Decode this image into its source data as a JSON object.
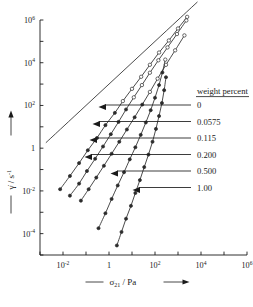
{
  "chart_data": {
    "type": "line",
    "title": "",
    "xlabel": "σ₂₁ / Pa",
    "ylabel": "γ̇ / s⁻¹",
    "xlabel_parts": {
      "dash": "——",
      "symbol": "σ",
      "subscript": "21",
      "slash": "/ Pa",
      "arrow": "⟶"
    },
    "ylabel_parts": {
      "dash": "——",
      "symbol": "γ̇",
      "slash": "/ s",
      "superscript": "-1",
      "arrow": "⟶"
    },
    "xscale": "log",
    "yscale": "log",
    "xlim": [
      0.001,
      1000000
    ],
    "ylim": [
      1e-05,
      1000000
    ],
    "grid": false,
    "legend_position": "right",
    "legend_title": "weight percent",
    "xticks_labeled": [
      "10⁻²",
      "1",
      "10²",
      "10⁴",
      "10⁶"
    ],
    "xtick_values": [
      0.01,
      1,
      100,
      10000,
      1000000
    ],
    "yticks_labeled": [
      "10⁶",
      "10⁴",
      "10²",
      "1",
      "10⁻²",
      "10⁻⁴"
    ],
    "ytick_values": [
      1000000,
      10000,
      100,
      1,
      0.01,
      0.0001
    ],
    "marker_note": "filled circles at low shear rate, open circles at high shear rate",
    "series": [
      {
        "name": "0",
        "label": "0",
        "marker": "none",
        "style": "straight-line",
        "x": [
          0.0018,
          0.01,
          0.1,
          1,
          10,
          100,
          1000,
          7000
        ],
        "y": [
          1.8,
          10,
          100,
          1000,
          10000,
          100000,
          1000000,
          7000000
        ]
      },
      {
        "name": "0.0575",
        "label": "0.0575",
        "marker": "mixed",
        "x": [
          0.0075,
          0.02,
          0.05,
          0.12,
          0.3,
          0.7,
          1.8,
          4,
          10,
          25,
          60,
          150,
          400,
          1000,
          2500
        ],
        "y": [
          0.012,
          0.05,
          0.2,
          0.8,
          3,
          12,
          45,
          160,
          600,
          2200,
          8000,
          30000,
          110000,
          400000,
          1400000
        ],
        "open_from_index": 7
      },
      {
        "name": "0.115",
        "label": "0.115",
        "marker": "mixed",
        "x": [
          0.02,
          0.05,
          0.11,
          0.25,
          0.55,
          1.2,
          2.6,
          5.5,
          12,
          27,
          60,
          140,
          350,
          900,
          2300
        ],
        "y": [
          0.006,
          0.022,
          0.085,
          0.32,
          1.2,
          4.5,
          17,
          65,
          240,
          900,
          3400,
          13000,
          52000,
          220000,
          950000
        ],
        "open_from_index": 8
      },
      {
        "name": "0.200",
        "label": "0.200",
        "marker": "mixed",
        "x": [
          0.06,
          0.13,
          0.28,
          0.6,
          1.3,
          2.8,
          6,
          13,
          28,
          60,
          130,
          300,
          750,
          1900
        ],
        "y": [
          0.0035,
          0.012,
          0.042,
          0.15,
          0.55,
          2.0,
          7.5,
          28,
          110,
          430,
          1800,
          8000,
          38000,
          190000
        ],
        "open_from_index": 9
      },
      {
        "name": "0.500",
        "label": "0.500",
        "marker": "filled",
        "x": [
          0.35,
          0.7,
          1.3,
          2.4,
          4.5,
          8,
          14,
          24,
          40,
          65,
          100,
          150,
          210,
          280
        ],
        "y": [
          0.00018,
          0.0009,
          0.0042,
          0.018,
          0.075,
          0.3,
          1.1,
          4.2,
          16,
          60,
          230,
          900,
          3500,
          14000
        ],
        "open_from_index": 13
      },
      {
        "name": "1.00",
        "label": "1.00",
        "marker": "filled",
        "x": [
          2.2,
          3.5,
          5.5,
          9,
          14,
          22,
          34,
          52,
          78,
          110,
          150,
          200,
          250,
          300
        ],
        "y": [
          2.8e-05,
          0.00012,
          0.0005,
          0.002,
          0.008,
          0.032,
          0.13,
          0.5,
          2.0,
          8.0,
          32,
          130,
          520,
          2100
        ],
        "open_from_index": 14
      }
    ]
  },
  "legend": {
    "header": "weight percent",
    "entries": [
      {
        "label": "0"
      },
      {
        "label": "0.0575"
      },
      {
        "label": "0.115"
      },
      {
        "label": "0.200"
      },
      {
        "label": "0.500"
      },
      {
        "label": "1.00"
      }
    ]
  },
  "axes": {
    "y": {
      "dash": "——",
      "symbol": "γ",
      "dot": "̇",
      "unit": "/ s",
      "exponent": "-1",
      "arrow": "⟶",
      "ticks": [
        {
          "mantissa": "10",
          "exp": "6"
        },
        {
          "mantissa": "10",
          "exp": "4"
        },
        {
          "mantissa": "10",
          "exp": "2"
        },
        {
          "mantissa": "1",
          "exp": ""
        },
        {
          "mantissa": "10",
          "exp": "-2"
        },
        {
          "mantissa": "10",
          "exp": "-4"
        }
      ]
    },
    "x": {
      "dash": "——",
      "symbol": "σ",
      "sub": "21",
      "unit": "/ Pa",
      "arrow": "⟶",
      "ticks": [
        {
          "mantissa": "10",
          "exp": "-2"
        },
        {
          "mantissa": "1",
          "exp": ""
        },
        {
          "mantissa": "10",
          "exp": "2"
        },
        {
          "mantissa": "10",
          "exp": "4"
        },
        {
          "mantissa": "10",
          "exp": "6"
        }
      ]
    }
  },
  "colors": {
    "ink": "#1a1a1a",
    "curve": "#2b2b2b",
    "background": "#ffffff"
  }
}
